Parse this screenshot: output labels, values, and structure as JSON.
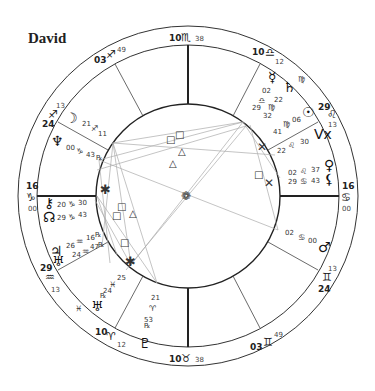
{
  "title": "David",
  "chart_type": "natal-wheel",
  "cusps": [
    {
      "house": "MC",
      "deg": "10",
      "sign": "♏",
      "min": "38"
    },
    {
      "house": "11",
      "deg": "10",
      "sign": "♎",
      "min": "12"
    },
    {
      "house": "12",
      "deg": "29",
      "sign": "♌",
      "min": "13"
    },
    {
      "house": "ASC",
      "deg": "16",
      "sign": "♋",
      "min": "00"
    },
    {
      "house": "2",
      "deg": "24",
      "sign": "♊",
      "min": "13"
    },
    {
      "house": "3",
      "deg": "03",
      "sign": "♊",
      "min": "49"
    },
    {
      "house": "IC",
      "deg": "10",
      "sign": "♉",
      "min": "38"
    },
    {
      "house": "5",
      "deg": "10",
      "sign": "♈",
      "min": "12"
    },
    {
      "house": "6",
      "deg": "29",
      "sign": "♒",
      "min": "13"
    },
    {
      "house": "DSC",
      "deg": "16",
      "sign": "♑",
      "min": "00"
    },
    {
      "house": "8",
      "deg": "24",
      "sign": "♐",
      "min": "13"
    },
    {
      "house": "9",
      "deg": "03",
      "sign": "♐",
      "min": "49"
    }
  ],
  "planets": [
    {
      "name": "Mercury",
      "glyph": "☿",
      "deg": "02",
      "sign": "♎",
      "min": "29"
    },
    {
      "name": "Saturn",
      "glyph": "♄",
      "deg": "22",
      "sign": "♍",
      "min": "32"
    },
    {
      "name": "Sun",
      "glyph": "☉",
      "deg": "06",
      "sign": "♍",
      "min": "41"
    },
    {
      "name": "Vertex",
      "glyph": "Vx",
      "deg": "22",
      "sign": "♌",
      "min": "30"
    },
    {
      "name": "Venus",
      "glyph": "♀",
      "deg": "02",
      "sign": "♌",
      "min": "37"
    },
    {
      "name": "Lilith",
      "glyph": "⚸",
      "deg": "29",
      "sign": "♋",
      "min": "43"
    },
    {
      "name": "Mars",
      "glyph": "♂",
      "deg": "02",
      "sign": "♋",
      "min": "00"
    },
    {
      "name": "Moon",
      "glyph": "☽",
      "deg": "21",
      "sign": "♐",
      "min": "11"
    },
    {
      "name": "Neptune",
      "glyph": "♆",
      "deg": "00",
      "sign": "♑",
      "min": "43",
      "retro": "℞"
    },
    {
      "name": "Chiron",
      "glyph": "⚷",
      "deg": "20",
      "sign": "♑",
      "min": "30"
    },
    {
      "name": "North Node",
      "glyph": "☊",
      "deg": "29",
      "sign": "♑",
      "min": "43"
    },
    {
      "name": "Jupiter",
      "glyph": "♃",
      "deg": "26",
      "sign": "♒",
      "min": "16",
      "retro": "℞"
    },
    {
      "name": "Uranus",
      "glyph": "♅",
      "deg": "24",
      "sign": "♒",
      "min": "47",
      "retro": "℞"
    },
    {
      "name": "Pluto",
      "glyph": "♇",
      "deg": "21",
      "sign": "♈",
      "min": "53",
      "retro": "℞"
    },
    {
      "name": "Pisces-marker",
      "glyph": "♓",
      "deg": "25",
      "sign": "♓",
      "min": "24",
      "retro": "℞"
    }
  ],
  "aspect_glyphs": {
    "square": "□",
    "trine": "△",
    "sextile": "✱",
    "quincunx": "⚻",
    "conjunction_cluster": "❁"
  },
  "colors": {
    "lines": "#222222",
    "aspect_lines": "#aaaaaa",
    "text": "#222222",
    "background": "#ffffff"
  }
}
